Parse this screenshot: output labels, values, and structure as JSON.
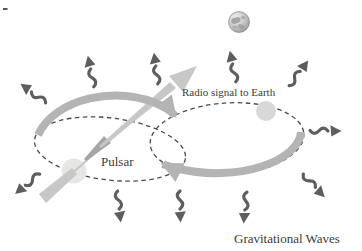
{
  "diagram": {
    "labels": {
      "pulsar": "Pulsar",
      "radio_signal": "Radio signal to Earth",
      "gravitational_waves": "Gravitational Waves"
    },
    "colors": {
      "background": "#ffffff",
      "orbit_dash": "#4a4a4a",
      "orbit_arrow": "#b4b4b4",
      "beam": "#c7c7c7",
      "beam_dark": "#a6a6a6",
      "wave": "#5e5e5e",
      "star_pulsar": "#e6e6e3",
      "star_companion": "#d8d8d5",
      "text": "#3c3c3c",
      "earth_light": "#f2f2f2",
      "earth_mid": "#b9b9b9",
      "earth_dark": "#8f8f8f"
    }
  }
}
